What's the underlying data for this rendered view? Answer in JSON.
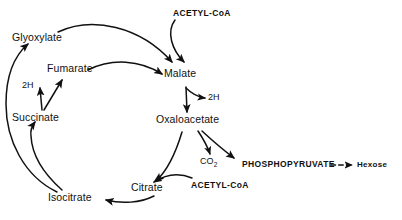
{
  "diagram": {
    "ink_color": "#111111",
    "background_color": "#ffffff",
    "nodes": {
      "glyoxylate": "Glyoxylate",
      "fumarate": "Fumarate",
      "succinate": "Succinate",
      "isocitrate": "Isocitrate",
      "citrate": "Citrate",
      "malate": "Malate",
      "oxaloacetate": "Oxaloacetate",
      "acetyl_coa_top": "ACETYL-CoA",
      "acetyl_coa_bottom": "ACETYL-CoA",
      "phosphopyruvate": "PHOSPHOPYRUVATE",
      "hexose": "Hexose",
      "co2_text": "CO",
      "co2_subscript": "2",
      "two_h_left": "2H",
      "two_h_right": "2H"
    },
    "edges": [
      {
        "from": "Isocitrate",
        "to": "Glyoxylate",
        "style": "solid-curve"
      },
      {
        "from": "Isocitrate",
        "to": "Succinate",
        "style": "solid-curve"
      },
      {
        "from": "Succinate",
        "to": "2H",
        "style": "solid-straight"
      },
      {
        "from": "Succinate",
        "to": "Fumarate",
        "style": "solid-straight"
      },
      {
        "from": "Fumarate",
        "to": "Malate",
        "style": "solid-curve"
      },
      {
        "from": "Glyoxylate",
        "to": "Malate",
        "style": "solid-curve"
      },
      {
        "from": "ACETYL-CoA",
        "to": "Malate",
        "style": "solid-curve"
      },
      {
        "from": "Malate",
        "to": "Oxaloacetate",
        "style": "solid-straight"
      },
      {
        "from": "Malate",
        "to": "2H",
        "style": "solid-curve"
      },
      {
        "from": "Oxaloacetate",
        "to": "CO2",
        "style": "solid-curve"
      },
      {
        "from": "Oxaloacetate",
        "to": "PHOSPHOPYRUVATE",
        "style": "solid-curve"
      },
      {
        "from": "PHOSPHOPYRUVATE",
        "to": "Hexose",
        "style": "dashed"
      },
      {
        "from": "Oxaloacetate",
        "to": "Citrate",
        "style": "solid-curve"
      },
      {
        "from": "ACETYL-CoA",
        "to": "Citrate",
        "style": "solid-curve"
      },
      {
        "from": "Citrate",
        "to": "Isocitrate",
        "style": "solid-curve"
      }
    ]
  }
}
